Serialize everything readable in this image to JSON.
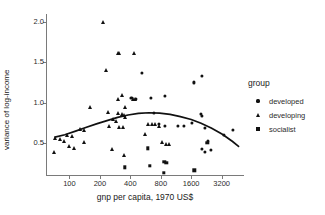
{
  "chart_data": {
    "type": "scatter",
    "title": "",
    "xlabel": "gnp per capita, 1970 US$",
    "ylabel": "variance of log-income",
    "xscale": "log2",
    "xticks": [
      100,
      200,
      400,
      800,
      1600,
      3200
    ],
    "xtick_labels": [
      "100",
      "200",
      "400",
      "800",
      "1600",
      "3200"
    ],
    "yticks": [
      0.5,
      1.0,
      1.5,
      2.0
    ],
    "ytick_labels": [
      "0.5",
      "1.0",
      "1.5",
      "2.0"
    ],
    "xlim": [
      60,
      5200
    ],
    "ylim": [
      0.1,
      2.1
    ],
    "grid": false,
    "legend": {
      "title": "group",
      "position": "right",
      "entries": [
        {
          "label": "developed",
          "marker": "circle"
        },
        {
          "label": "developing",
          "marker": "triangle"
        },
        {
          "label": "socialist",
          "marker": "square"
        }
      ]
    },
    "marker_color": "#111111",
    "curve_color": "#111111",
    "axis_color": "#7a7a7a",
    "fit": {
      "name": "loess-quadratic-fit",
      "x": [
        72,
        90,
        115,
        145,
        185,
        235,
        300,
        380,
        480,
        610,
        780,
        990,
        1250,
        1600,
        2000,
        2550,
        3250,
        4100,
        4700
      ],
      "y": [
        0.57,
        0.6,
        0.645,
        0.69,
        0.735,
        0.775,
        0.815,
        0.845,
        0.865,
        0.873,
        0.868,
        0.852,
        0.826,
        0.789,
        0.742,
        0.681,
        0.606,
        0.516,
        0.455
      ]
    },
    "series": [
      {
        "name": "developed",
        "marker": "circle",
        "points": [
          [
            1700,
            1.25
          ],
          [
            2050,
            1.33
          ],
          [
            1620,
            0.75
          ],
          [
            1980,
            0.855
          ],
          [
            2020,
            0.835
          ],
          [
            2180,
            0.69
          ],
          [
            2350,
            0.52
          ],
          [
            2050,
            0.42
          ],
          [
            2180,
            0.385
          ],
          [
            2480,
            0.41
          ],
          [
            3350,
            0.6
          ],
          [
            4100,
            0.655
          ],
          [
            1180,
            0.705
          ],
          [
            1350,
            0.71
          ],
          [
            880,
            1.08
          ],
          [
            640,
            1.06
          ],
          [
            520,
            1.37
          ],
          [
            455,
            1.05
          ],
          [
            410,
            1.06
          ],
          [
            690,
            0.875
          ],
          [
            770,
            0.735
          ],
          [
            880,
            0.71
          ]
        ]
      },
      {
        "name": "developing",
        "marker": "triangle",
        "points": [
          [
            215,
            2.0
          ],
          [
            300,
            1.62
          ],
          [
            312,
            1.61
          ],
          [
            435,
            1.62
          ],
          [
            232,
            1.41
          ],
          [
            330,
            1.09
          ],
          [
            300,
            1.05
          ],
          [
            355,
            0.95
          ],
          [
            420,
            1.05
          ],
          [
            445,
            1.05
          ],
          [
            160,
            0.95
          ],
          [
            238,
            0.88
          ],
          [
            300,
            0.87
          ],
          [
            330,
            0.855
          ],
          [
            345,
            0.84
          ],
          [
            352,
            0.82
          ],
          [
            268,
            0.8
          ],
          [
            290,
            0.775
          ],
          [
            310,
            0.7
          ],
          [
            248,
            0.715
          ],
          [
            340,
            0.695
          ],
          [
            600,
            0.735
          ],
          [
            655,
            0.73
          ],
          [
            700,
            0.74
          ],
          [
            128,
            0.675
          ],
          [
            138,
            0.665
          ],
          [
            95,
            0.6
          ],
          [
            105,
            0.585
          ],
          [
            72,
            0.565
          ],
          [
            80,
            0.545
          ],
          [
            88,
            0.52
          ],
          [
            140,
            0.505
          ],
          [
            112,
            0.44
          ],
          [
            98,
            0.455
          ],
          [
            70,
            0.385
          ],
          [
            262,
            0.425
          ],
          [
            555,
            0.605
          ],
          [
            770,
            0.705
          ],
          [
            815,
            0.51
          ],
          [
            905,
            0.49
          ],
          [
            960,
            0.485
          ],
          [
            345,
            0.35
          ]
        ]
      },
      {
        "name": "socialist",
        "marker": "square",
        "points": [
          [
            355,
            0.195
          ],
          [
            620,
            0.215
          ],
          [
            855,
            0.125
          ],
          [
            865,
            0.265
          ],
          [
            905,
            0.255
          ],
          [
            600,
            0.43
          ],
          [
            1720,
            0.16
          ],
          [
            2300,
            0.5
          ]
        ]
      }
    ]
  }
}
